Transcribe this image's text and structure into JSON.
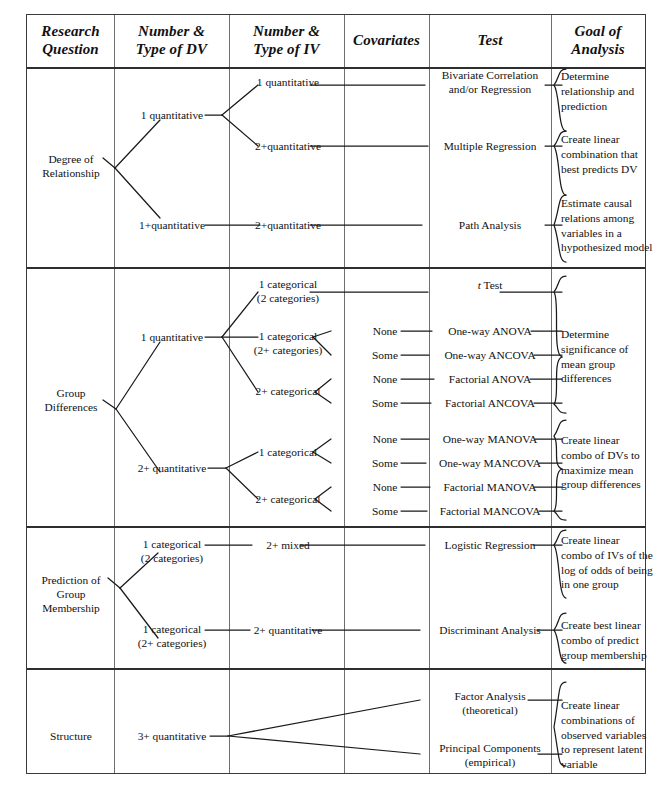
{
  "table": {
    "headers": [
      {
        "id": "research-question",
        "line1": "Research",
        "line2": "Question"
      },
      {
        "id": "number-type-dv",
        "line1": "Number &",
        "line2": "Type of DV"
      },
      {
        "id": "number-type-iv",
        "line1": "Number &",
        "line2": "Type of IV"
      },
      {
        "id": "covariates",
        "line1": "Covariates",
        "line2": ""
      },
      {
        "id": "test",
        "line1": "Test",
        "line2": ""
      },
      {
        "id": "goal-of-analysis",
        "line1": "Goal of",
        "line2": "Analysis"
      }
    ]
  },
  "sections": [
    {
      "id": "degree-of-relationship",
      "question_line1": "Degree of",
      "question_line2": "Relationship",
      "dv": [
        {
          "id": "dv-1-quant",
          "label": "1 quantitative"
        },
        {
          "id": "dv-1plus-quant",
          "label": "1+quantitative"
        }
      ],
      "iv": [
        {
          "id": "iv-1-quant",
          "label": "1 quantitative"
        },
        {
          "id": "iv-2plus-quant-a",
          "label": "2+quantitative"
        },
        {
          "id": "iv-2plus-quant-b",
          "label": "2+quantitative"
        }
      ],
      "covariates": [],
      "tests": [
        {
          "id": "test-bivariate",
          "line1": "Bivariate Correlation",
          "line2": "and/or Regression"
        },
        {
          "id": "test-multiple-regression",
          "line1": "Multiple Regression",
          "line2": ""
        },
        {
          "id": "test-path-analysis",
          "line1": "Path Analysis",
          "line2": ""
        }
      ],
      "goals": [
        {
          "id": "goal-determine-relationship",
          "text": "Determine relationship and prediction"
        },
        {
          "id": "goal-create-linear-combination",
          "text": "Create linear combination that best predicts DV"
        },
        {
          "id": "goal-estimate-causal",
          "text": "Estimate causal relations among variables in a hypothesized model"
        }
      ]
    },
    {
      "id": "group-differences",
      "question_line1": "Group",
      "question_line2": "Differences",
      "dv": [
        {
          "id": "dv-1-quant",
          "label": "1 quantitative"
        },
        {
          "id": "dv-2plus-quant",
          "label": "2+ quantitative"
        }
      ],
      "iv": [
        {
          "id": "iv-1-cat-2",
          "line1": "1 categorical",
          "line2": "(2 categories)"
        },
        {
          "id": "iv-1-cat-2plus",
          "line1": "1 categorical",
          "line2": "(2+ categories)"
        },
        {
          "id": "iv-2plus-cat-a",
          "line1": "2+ categorical",
          "line2": ""
        },
        {
          "id": "iv-1-cat-b",
          "line1": "1 categorical",
          "line2": ""
        },
        {
          "id": "iv-2plus-cat-b",
          "line1": "2+ categorical",
          "line2": ""
        }
      ],
      "covariates": [
        "None",
        "Some",
        "None",
        "Some",
        "None",
        "Some",
        "None",
        "Some"
      ],
      "tests": [
        {
          "id": "test-t-test",
          "italic_prefix": "t",
          "line1": " Test",
          "line2": ""
        },
        {
          "id": "test-one-way-anova",
          "line1": "One-way ANOVA",
          "line2": ""
        },
        {
          "id": "test-one-way-ancova",
          "line1": "One-way ANCOVA",
          "line2": ""
        },
        {
          "id": "test-factorial-anova",
          "line1": "Factorial ANOVA",
          "line2": ""
        },
        {
          "id": "test-factorial-ancova",
          "line1": "Factorial ANCOVA",
          "line2": ""
        },
        {
          "id": "test-one-way-manova",
          "line1": "One-way MANOVA",
          "line2": ""
        },
        {
          "id": "test-one-way-mancova",
          "line1": "One-way MANCOVA",
          "line2": ""
        },
        {
          "id": "test-factorial-manova",
          "line1": "Factorial MANOVA",
          "line2": ""
        },
        {
          "id": "test-factorial-mancova",
          "line1": "Factorial MANCOVA",
          "line2": ""
        }
      ],
      "goals": [
        {
          "id": "goal-determine-significance",
          "text": "Determine significance of mean group differences"
        },
        {
          "id": "goal-create-linear-combo-dvs",
          "text": "Create linear combo of DVs to maximize mean group differences"
        }
      ]
    },
    {
      "id": "prediction-of-group-membership",
      "question_line1": "Prediction of",
      "question_line2": "Group",
      "question_line3": "Membership",
      "dv": [
        {
          "id": "dv-1-cat-2",
          "line1": "1 categorical",
          "line2": "(2 categories)"
        },
        {
          "id": "dv-1-cat-2plus",
          "line1": "1 categorical",
          "line2": "(2+ categories)"
        }
      ],
      "iv": [
        {
          "id": "iv-2plus-mixed",
          "label": "2+ mixed"
        },
        {
          "id": "iv-2plus-quant",
          "label": "2+ quantitative"
        }
      ],
      "covariates": [],
      "tests": [
        {
          "id": "test-logistic-regression",
          "line1": "Logistic Regression",
          "line2": ""
        },
        {
          "id": "test-discriminant-analysis",
          "line1": "Discriminant Analysis",
          "line2": ""
        }
      ],
      "goals": [
        {
          "id": "goal-create-linear-combo-ivs",
          "text": "Create linear combo of IVs of the log of odds of being in one group"
        },
        {
          "id": "goal-create-best-linear-combo",
          "text": "Create best linear combo of predict group membership"
        }
      ]
    },
    {
      "id": "structure",
      "question_line1": "Structure",
      "question_line2": "",
      "dv": [
        {
          "id": "dv-3plus-quant",
          "label": "3+ quantitative"
        }
      ],
      "iv": [],
      "covariates": [],
      "tests": [
        {
          "id": "test-factor-analysis",
          "line1": "Factor Analysis",
          "line2": "(theoretical)"
        },
        {
          "id": "test-principal-components",
          "line1": "Principal Components",
          "line2": "(empirical)"
        }
      ],
      "goals": [
        {
          "id": "goal-create-linear-combinations",
          "text": "Create linear combinations of observed variables to represent latent variable"
        }
      ]
    }
  ],
  "colors": {
    "border": "#3a3a3a",
    "grid": "#6f6f6f",
    "line": "#1a1a1a",
    "text": "#111111"
  }
}
